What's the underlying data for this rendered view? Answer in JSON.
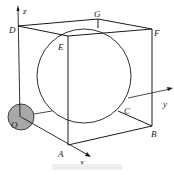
{
  "figure": {
    "type": "3d-geometry-diagram",
    "axes": {
      "x": "x",
      "y": "y",
      "z": "z"
    },
    "points": {
      "O": "O",
      "A": "A",
      "B": "B",
      "C": "C",
      "D": "D",
      "E": "E",
      "F": "F",
      "G": "G"
    },
    "colors": {
      "line": "#1a1a1a",
      "small_sphere_fill": "#a8a8a8",
      "background": "#ffffff"
    }
  }
}
